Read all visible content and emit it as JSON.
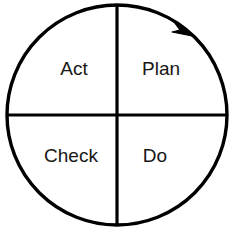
{
  "diagram": {
    "name": "PDCA Cycle",
    "type": "cycle-wheel",
    "background_color": "#ffffff",
    "stroke_color": "#000000",
    "text_color": "#161616",
    "circle": {
      "center_x": 117,
      "center_y": 115,
      "radius": 110,
      "stroke_width": 3.4
    },
    "dividers": {
      "vertical_x": 117,
      "horizontal_y": 115,
      "stroke_width": 3.2
    },
    "quadrants": [
      {
        "id": "act",
        "label": "Act",
        "position": "top-left",
        "x": 74,
        "y": 70
      },
      {
        "id": "plan",
        "label": "Plan",
        "position": "top-right",
        "x": 161,
        "y": 70
      },
      {
        "id": "check",
        "label": "Check",
        "position": "bottom-left",
        "x": 71,
        "y": 157
      },
      {
        "id": "do",
        "label": "Do",
        "position": "bottom-right",
        "x": 155,
        "y": 157
      }
    ],
    "arrow": {
      "name": "clockwise-arrow",
      "direction": "clockwise",
      "tip_x": 191,
      "tip_y": 34,
      "fill": "#000000"
    }
  }
}
